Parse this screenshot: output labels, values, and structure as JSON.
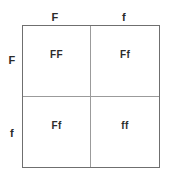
{
  "figure": {
    "type": "punnett-square",
    "rows": 2,
    "columns": 2,
    "border_color": "#6f6f6f",
    "divider_color": "#9b9b9b",
    "text_color": "#2b2b2b",
    "background_color": "#ffffff"
  },
  "column_labels": [
    {
      "text": "F"
    },
    {
      "text": "f"
    }
  ],
  "row_labels": [
    {
      "text": "F"
    },
    {
      "text": "f"
    }
  ],
  "cells": [
    {
      "text": "FF"
    },
    {
      "text": "Ff"
    },
    {
      "text": "Ff"
    },
    {
      "text": "ff"
    }
  ]
}
